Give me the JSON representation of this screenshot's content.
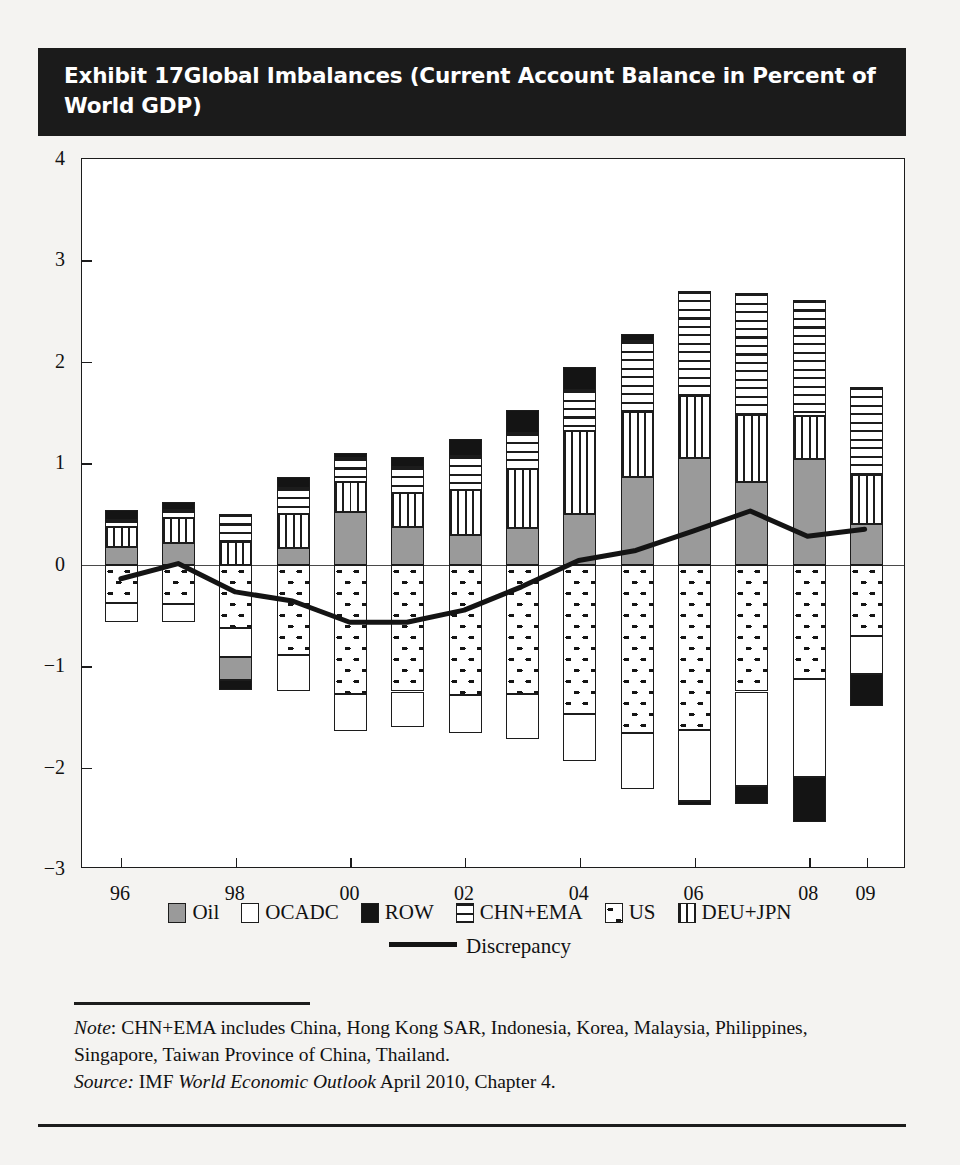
{
  "exhibit": {
    "number_label": "Exhibit 17",
    "title": "Global Imbalances (Current Account Balance in Percent of World GDP)"
  },
  "notes": {
    "note_label": "Note",
    "note_text": ": CHN+EMA includes China, Hong Kong SAR, Indonesia, Korea, Malaysia, Philippines, Singapore, Taiwan Province of China, Thailand.",
    "source_label": "Source:",
    "source_text_pre": " IMF ",
    "source_italic": "World Economic Outlook",
    "source_text_post": " April 2010, Chapter 4."
  },
  "colors": {
    "oil": "#9a9a9a",
    "ocadc": "#ffffff",
    "row": "#141414",
    "chn_ema": "#ffffff",
    "us": "#ffffff",
    "deu_jpn": "#ffffff",
    "discrepancy": "#141414",
    "axis": "#1c1c1c",
    "title_bg": "#1b1b1b",
    "title_fg": "#ffffff"
  },
  "chart_data": {
    "type": "bar",
    "title": "Global Imbalances (Current Account Balance in Percent of World GDP)",
    "xlabel": "",
    "ylabel": "",
    "ylim": [
      -3,
      4
    ],
    "yticks": [
      4,
      3,
      2,
      1,
      0,
      -1,
      -2,
      -3
    ],
    "ytick_labels": [
      "4",
      "3",
      "2",
      "1",
      "0",
      "−1",
      "−2",
      "−3"
    ],
    "grid": false,
    "stacked": true,
    "legend_position": "bottom",
    "x": [
      1996,
      1997,
      1998,
      1999,
      2000,
      2001,
      2002,
      2003,
      2004,
      2005,
      2006,
      2007,
      2008,
      2009
    ],
    "categories": [
      "96",
      "97",
      "98",
      "99",
      "00",
      "01",
      "02",
      "03",
      "04",
      "05",
      "06",
      "07",
      "08",
      "09"
    ],
    "xtick_positions": [
      1996,
      1998,
      2000,
      2002,
      2004,
      2006,
      2008,
      2009
    ],
    "xtick_labels": [
      "96",
      "98",
      "00",
      "02",
      "04",
      "06",
      "08",
      "09"
    ],
    "series": [
      {
        "name": "Oil",
        "pattern": "solid-gray",
        "values": [
          0.17,
          0.21,
          -0.23,
          0.16,
          0.52,
          0.37,
          0.29,
          0.36,
          0.5,
          0.86,
          1.05,
          0.82,
          1.04,
          0.4
        ]
      },
      {
        "name": "OCADC",
        "pattern": "white",
        "values": [
          -0.18,
          -0.17,
          -0.29,
          -0.36,
          -0.37,
          -0.35,
          -0.38,
          -0.45,
          -0.47,
          -0.55,
          -0.7,
          -0.93,
          -0.96,
          -0.38
        ]
      },
      {
        "name": "ROW",
        "pattern": "solid-black",
        "values": [
          0.1,
          0.08,
          -0.1,
          0.1,
          0.05,
          0.1,
          0.17,
          0.23,
          0.23,
          0.06,
          -0.04,
          -0.18,
          -0.45,
          -0.31
        ]
      },
      {
        "name": "CHN+EMA",
        "pattern": "horizontal-lines",
        "values": [
          0.07,
          0.08,
          0.28,
          0.26,
          0.23,
          0.25,
          0.33,
          0.36,
          0.4,
          0.7,
          1.04,
          1.2,
          1.14,
          0.87
        ]
      },
      {
        "name": "US",
        "pattern": "dotted",
        "values": [
          -0.38,
          -0.39,
          -0.62,
          -0.89,
          -1.27,
          -1.25,
          -1.28,
          -1.27,
          -1.47,
          -1.66,
          -1.63,
          -1.25,
          -1.13,
          -0.7
        ]
      },
      {
        "name": "DEU+JPN",
        "pattern": "vertical-lines",
        "values": [
          0.2,
          0.25,
          0.22,
          0.34,
          0.3,
          0.34,
          0.45,
          0.58,
          0.82,
          0.65,
          0.61,
          0.66,
          0.43,
          0.48
        ]
      }
    ],
    "discrepancy_line": {
      "name": "Discrepancy",
      "x": [
        1996,
        1997,
        1998,
        1999,
        2000,
        2001,
        2002,
        2003,
        2004,
        2005,
        2006,
        2007,
        2008,
        2009
      ],
      "values": [
        -0.15,
        0.0,
        -0.28,
        -0.37,
        -0.58,
        -0.58,
        -0.46,
        -0.23,
        0.03,
        0.13,
        0.32,
        0.52,
        0.27,
        0.34
      ]
    },
    "legend_entries": [
      {
        "label": "Oil",
        "pattern": "solid-gray"
      },
      {
        "label": "OCADC",
        "pattern": "white"
      },
      {
        "label": "ROW",
        "pattern": "solid-black"
      },
      {
        "label": "CHN+EMA",
        "pattern": "horizontal-lines"
      },
      {
        "label": "US",
        "pattern": "dotted"
      },
      {
        "label": "DEU+JPN",
        "pattern": "vertical-lines"
      }
    ],
    "discrepancy_legend_label": "Discrepancy"
  }
}
